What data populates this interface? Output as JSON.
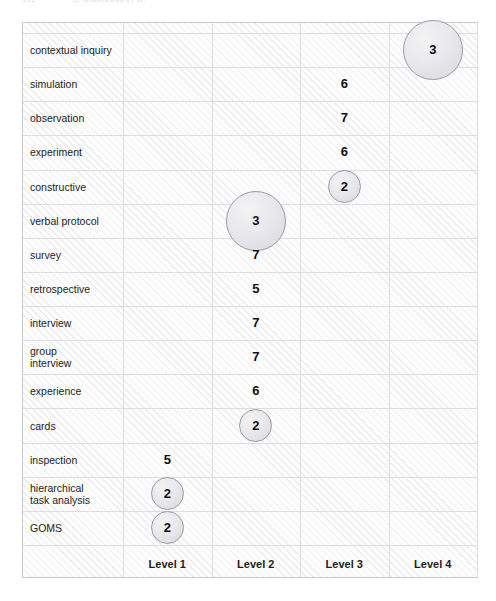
{
  "scan_header": {
    "page_number": "152",
    "running_title": "A. Kurniawan et al."
  },
  "chart_data": {
    "type": "bubble",
    "title": "",
    "xlabel": "",
    "ylabel": "",
    "grid": true,
    "legend": "none",
    "categories_x": [
      "Level 1",
      "Level 2",
      "Level 3",
      "Level 4"
    ],
    "categories_y": [
      "contextual inquiry",
      "simulation",
      "observation",
      "experiment",
      "constructive",
      "verbal protocol",
      "survey",
      "retrospective",
      "interview",
      "group\ninterview",
      " experience",
      "cards",
      "inspection",
      "hierarchical\ntask analysis",
      "GOMS"
    ],
    "points": [
      {
        "method": "contextual inquiry",
        "level": "Level 4",
        "value": 3
      },
      {
        "method": "simulation",
        "level": "Level 3",
        "value": 6
      },
      {
        "method": "observation",
        "level": "Level 3",
        "value": 7
      },
      {
        "method": "experiment",
        "level": "Level 3",
        "value": 6
      },
      {
        "method": "constructive",
        "level": "Level 3",
        "value": 2
      },
      {
        "method": "verbal protocol",
        "level": "Level 2",
        "value": 3
      },
      {
        "method": "survey",
        "level": "Level 2",
        "value": 7
      },
      {
        "method": "retrospective",
        "level": "Level 2",
        "value": 5
      },
      {
        "method": "interview",
        "level": "Level 2",
        "value": 7
      },
      {
        "method": "group interview",
        "level": "Level 2",
        "value": 7
      },
      {
        "method": "experience",
        "level": "Level 2",
        "value": 6
      },
      {
        "method": "cards",
        "level": "Level 2",
        "value": 2
      },
      {
        "method": "inspection",
        "level": "Level 1",
        "value": 5
      },
      {
        "method": "hierarchical task analysis",
        "level": "Level 1",
        "value": 2
      },
      {
        "method": "GOMS",
        "level": "Level 1",
        "value": 2
      }
    ],
    "value_range": [
      2,
      7
    ],
    "colors": {
      "bubble_fill": "#e6e6ea",
      "bubble_border": "#9a9aa2",
      "grid": "#dcdce2",
      "panel_border": "#c9c9cf",
      "text": "#1d1d20"
    }
  }
}
